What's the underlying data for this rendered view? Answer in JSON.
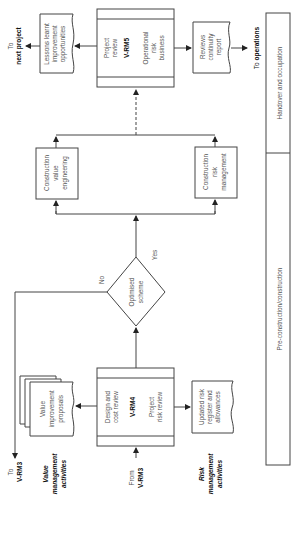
{
  "phases": {
    "handover": "Handover and occupation",
    "preconstruction": "Pre-construction/construction"
  },
  "vrm5": {
    "label": "V-RM5",
    "top_text": [
      "Project",
      "review"
    ],
    "bottom_text": [
      "Operational",
      "risk",
      "business"
    ]
  },
  "vrm4": {
    "label": "V-RM4",
    "top_text": [
      "Design and",
      "cost review"
    ],
    "bottom_text": [
      "Project",
      "risk review"
    ]
  },
  "lessons": [
    "Lessons learnt",
    "improvement",
    "opportunities"
  ],
  "reviews": [
    "Reviews",
    "continuity",
    "report"
  ],
  "value_proposals": [
    "Value",
    "improvement",
    "proposals"
  ],
  "risk_register": [
    "Updated risk",
    "register and",
    "allowances"
  ],
  "construction_ve": [
    "Construction",
    "value",
    "engineering"
  ],
  "construction_rm": [
    "Construction",
    "risk",
    "management"
  ],
  "decision": {
    "text": [
      "Optimised",
      "scheme"
    ],
    "yes": "Yes",
    "no": "No"
  },
  "connectors": {
    "to_next_project": [
      "To",
      "next project"
    ],
    "to_operations_prefix": "To ",
    "to_operations_bold": "operations",
    "to_vrm3": [
      "To",
      "V-RM3"
    ],
    "from_vrm3": [
      "From",
      "V-RM3"
    ]
  },
  "lanes": {
    "value": [
      "Value",
      "management",
      "activities"
    ],
    "risk": [
      "Risk",
      "management",
      "activities"
    ]
  },
  "colors": {
    "line": "#444444",
    "text": "#555555",
    "bold_text": "#111111",
    "background": "#ffffff"
  }
}
